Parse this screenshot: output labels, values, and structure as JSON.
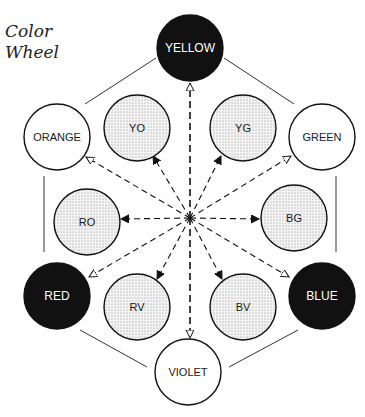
{
  "title": {
    "line1": "Color",
    "line2": "Wheel"
  },
  "center": {
    "x": 190,
    "y": 218
  },
  "colors": {
    "ink": "#111111",
    "stipple": "#9a9a9a",
    "paper": "#ffffff"
  },
  "nodes": [
    {
      "id": "yellow",
      "label": "YELLOW",
      "type": "primary",
      "cx": 190,
      "cy": 48,
      "r": 33
    },
    {
      "id": "orange",
      "label": "ORANGE",
      "type": "secondary",
      "cx": 57,
      "cy": 137,
      "r": 33
    },
    {
      "id": "green",
      "label": "GREEN",
      "type": "secondary",
      "cx": 322,
      "cy": 137,
      "r": 33
    },
    {
      "id": "yo",
      "label": "YO",
      "type": "tertiary",
      "cx": 137,
      "cy": 128,
      "r": 33
    },
    {
      "id": "yg",
      "label": "YG",
      "type": "tertiary",
      "cx": 243,
      "cy": 128,
      "r": 33
    },
    {
      "id": "ro",
      "label": "RO",
      "type": "tertiary",
      "cx": 87,
      "cy": 222,
      "r": 33
    },
    {
      "id": "bg",
      "label": "BG",
      "type": "tertiary",
      "cx": 294,
      "cy": 218,
      "r": 33
    },
    {
      "id": "red",
      "label": "RED",
      "type": "primary",
      "cx": 57,
      "cy": 296,
      "r": 33
    },
    {
      "id": "blue",
      "label": "BLUE",
      "type": "primary",
      "cx": 322,
      "cy": 296,
      "r": 33
    },
    {
      "id": "rv",
      "label": "RV",
      "type": "tertiary",
      "cx": 137,
      "cy": 307,
      "r": 33
    },
    {
      "id": "bv",
      "label": "BV",
      "type": "tertiary",
      "cx": 243,
      "cy": 307,
      "r": 33
    },
    {
      "id": "violet",
      "label": "VIOLET",
      "type": "secondary",
      "cx": 188,
      "cy": 372,
      "r": 33
    }
  ],
  "hexagon_edges": [
    {
      "from": "yellow",
      "to": "orange",
      "x1": 156,
      "y1": 58,
      "x2": 85,
      "y2": 104
    },
    {
      "from": "yellow",
      "to": "green",
      "x1": 224,
      "y1": 58,
      "x2": 294,
      "y2": 104
    },
    {
      "from": "orange",
      "to": "red",
      "x1": 44,
      "y1": 176,
      "x2": 44,
      "y2": 252
    },
    {
      "from": "green",
      "to": "blue",
      "x1": 336,
      "y1": 176,
      "x2": 336,
      "y2": 252
    },
    {
      "from": "red",
      "to": "violet",
      "x1": 80,
      "y1": 330,
      "x2": 147,
      "y2": 367
    },
    {
      "from": "blue",
      "to": "violet",
      "x1": 298,
      "y1": 330,
      "x2": 229,
      "y2": 367
    }
  ],
  "arrows": [
    {
      "to": "yellow",
      "head": "open",
      "x2": 190,
      "y2": 83
    },
    {
      "to": "violet",
      "head": "open",
      "x2": 190,
      "y2": 338
    },
    {
      "to": "orange",
      "head": "open",
      "x2": 86,
      "y2": 157
    },
    {
      "to": "green",
      "head": "open",
      "x2": 291,
      "y2": 156
    },
    {
      "to": "red",
      "head": "open",
      "x2": 89,
      "y2": 277
    },
    {
      "to": "blue",
      "head": "open",
      "x2": 289,
      "y2": 277
    },
    {
      "to": "yo",
      "head": "filled",
      "x2": 153,
      "y2": 156
    },
    {
      "to": "yg",
      "head": "filled",
      "x2": 221,
      "y2": 156
    },
    {
      "to": "ro",
      "head": "filled",
      "x2": 121,
      "y2": 219
    },
    {
      "to": "bg",
      "head": "filled",
      "x2": 259,
      "y2": 219
    },
    {
      "to": "rv",
      "head": "filled",
      "x2": 157,
      "y2": 279
    },
    {
      "to": "bv",
      "head": "filled",
      "x2": 222,
      "y2": 279
    }
  ]
}
